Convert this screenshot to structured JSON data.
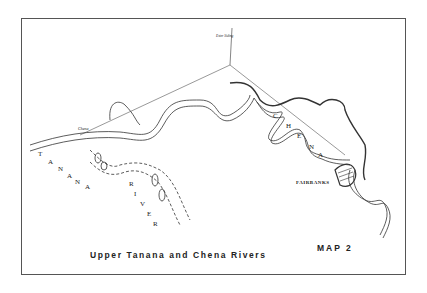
{
  "map": {
    "title": "Upper Tanana and Chena Rivers",
    "map_number": "MAP 2",
    "labels": {
      "fairbanks": "FAIRBANKS",
      "tanana_river": [
        "T",
        "A",
        "N",
        "A",
        "N",
        "A"
      ],
      "river_word": [
        "R",
        "I",
        "V",
        "E",
        "R"
      ],
      "chena_word": [
        "C",
        "H",
        "E",
        "N",
        "A"
      ],
      "chena_town": "Chena",
      "ester_siding": "Ester Siding"
    }
  }
}
